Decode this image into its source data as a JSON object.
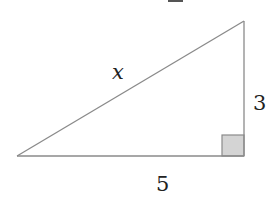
{
  "diagram": {
    "type": "right-triangle",
    "labels": {
      "hypotenuse": "x",
      "vertical_leg": "3",
      "horizontal_leg": "5"
    },
    "right_angle_marker": true,
    "colors": {
      "stroke": "#8a8a8a",
      "marker_fill": "#d4d4d4",
      "text": "#222222"
    }
  }
}
